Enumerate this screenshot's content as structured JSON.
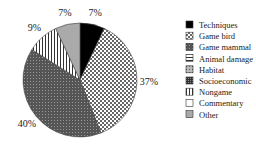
{
  "chart_data": {
    "type": "pie",
    "title": "",
    "slices": [
      {
        "label": "Techniques",
        "value": 7,
        "display": "7%",
        "pattern": "solid-black"
      },
      {
        "label": "Game bird",
        "value": 37,
        "display": "37%",
        "pattern": "checker"
      },
      {
        "label": "Game mammal",
        "value": 40,
        "display": "40%",
        "pattern": "dense-dark"
      },
      {
        "label": "Nongame",
        "value": 9,
        "display": "9%",
        "pattern": "vertical-stripes"
      },
      {
        "label": "Other",
        "value": 7,
        "display": "7%",
        "pattern": "gray"
      }
    ],
    "legend": {
      "placement": "right",
      "entries": [
        {
          "label": "Techniques",
          "pattern": "solid-black"
        },
        {
          "label": "Game bird",
          "pattern": "checker"
        },
        {
          "label": "Game mammal",
          "pattern": "dense-dark"
        },
        {
          "label": "Animal damage",
          "pattern": "horizontal-stripes"
        },
        {
          "label": "Habitat",
          "pattern": "dots"
        },
        {
          "label": "Socioeconomic",
          "pattern": "dense-dark2"
        },
        {
          "label": "Nongame",
          "pattern": "vertical-stripes"
        },
        {
          "label": "Commentary",
          "pattern": "white"
        },
        {
          "label": "Other",
          "pattern": "gray"
        }
      ]
    }
  }
}
